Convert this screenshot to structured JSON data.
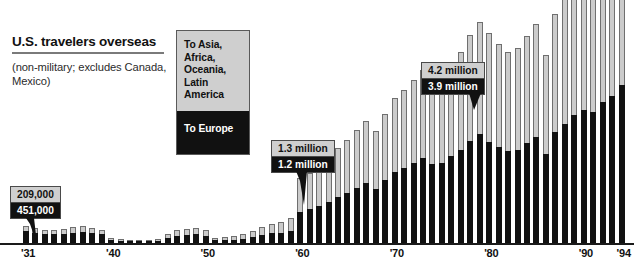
{
  "header": {
    "title": "U.S. travelers overseas",
    "subtitle": "(non-military; excludes Canada, Mexico)"
  },
  "legend": {
    "series_gray_label": "To Asia, Africa, Oceania, Latin America",
    "series_black_label": "To Europe",
    "gray_color": "#cbcbcb",
    "black_color": "#111111"
  },
  "callouts": [
    {
      "id": "callout-1931",
      "gray_value": "209,000",
      "black_value": "451,000",
      "year": "'31"
    },
    {
      "id": "callout-1960",
      "gray_value": "1.3 million",
      "black_value": "1.2 million",
      "year": "'60"
    },
    {
      "id": "callout-1980",
      "gray_value": "4.2 million",
      "black_value": "3.9 million",
      "year": "'80"
    }
  ],
  "axis": {
    "ticks": [
      "'31",
      "'40",
      "'50",
      "'60",
      "'70",
      "'80",
      "'90",
      "'94"
    ]
  },
  "chart_data": {
    "type": "bar",
    "subtype": "stacked-column",
    "title": "U.S. travelers overseas",
    "subtitle": "(non-military; excludes Canada, Mexico)",
    "xlabel": "",
    "ylabel": "",
    "grid": false,
    "legend_position": "top-left-inset",
    "unit": "millions of travelers",
    "ylim": [
      0,
      9.2
    ],
    "categories": [
      "'31",
      "'32",
      "'33",
      "'34",
      "'35",
      "'36",
      "'37",
      "'38",
      "'39",
      "'40",
      "'41",
      "'42",
      "'43",
      "'44",
      "'45",
      "'46",
      "'47",
      "'48",
      "'49",
      "'50",
      "'51",
      "'52",
      "'53",
      "'54",
      "'55",
      "'56",
      "'57",
      "'58",
      "'59",
      "'60",
      "'61",
      "'62",
      "'63",
      "'64",
      "'65",
      "'66",
      "'67",
      "'68",
      "'69",
      "'70",
      "'71",
      "'72",
      "'73",
      "'74",
      "'75",
      "'76",
      "'77",
      "'78",
      "'79",
      "'80",
      "'81",
      "'82",
      "'83",
      "'84",
      "'85",
      "'86",
      "'87",
      "'88",
      "'89",
      "'90",
      "'91",
      "'92",
      "'93",
      "'94"
    ],
    "xtick_labels": [
      "'31",
      "'40",
      "'50",
      "'60",
      "'70",
      "'80",
      "'90",
      "'94"
    ],
    "series": [
      {
        "name": "To Europe",
        "color": "#111111",
        "values": [
          0.451,
          0.4,
          0.33,
          0.33,
          0.36,
          0.4,
          0.44,
          0.4,
          0.33,
          0.11,
          0.07,
          0.04,
          0.03,
          0.03,
          0.05,
          0.2,
          0.29,
          0.31,
          0.34,
          0.29,
          0.1,
          0.11,
          0.13,
          0.16,
          0.23,
          0.3,
          0.37,
          0.4,
          0.47,
          1.2,
          1.3,
          1.42,
          1.58,
          1.78,
          1.92,
          2.12,
          2.32,
          2.08,
          2.45,
          2.75,
          2.9,
          3.1,
          3.3,
          3.05,
          3.1,
          3.35,
          3.6,
          3.95,
          4.2,
          3.9,
          3.7,
          3.55,
          3.6,
          3.85,
          4.1,
          3.45,
          4.3,
          4.6,
          4.95,
          5.15,
          5.05,
          5.45,
          5.7,
          6.1
        ],
        "unit": "millions"
      },
      {
        "name": "To Asia, Africa, Oceania, Latin America",
        "color": "#cbcbcb",
        "values": [
          0.209,
          0.19,
          0.17,
          0.17,
          0.18,
          0.2,
          0.21,
          0.19,
          0.17,
          0.1,
          0.07,
          0.05,
          0.04,
          0.04,
          0.06,
          0.14,
          0.2,
          0.22,
          0.24,
          0.22,
          0.1,
          0.12,
          0.15,
          0.18,
          0.24,
          0.31,
          0.38,
          0.42,
          0.5,
          1.3,
          1.42,
          1.58,
          1.72,
          1.9,
          2.05,
          2.25,
          2.4,
          2.25,
          2.55,
          2.85,
          3.0,
          3.2,
          3.4,
          3.2,
          3.3,
          3.55,
          3.8,
          4.1,
          4.35,
          4.2,
          4.0,
          3.85,
          3.95,
          4.15,
          4.35,
          3.8,
          4.55,
          4.85,
          5.2,
          5.4,
          5.3,
          5.7,
          5.95,
          6.3
        ],
        "unit": "millions"
      }
    ]
  }
}
